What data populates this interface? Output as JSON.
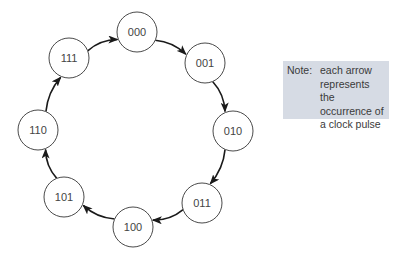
{
  "diagram": {
    "type": "state-cycle",
    "node_radius": 20,
    "nodes": [
      {
        "id": "000",
        "label": "000",
        "cx": 137,
        "cy": 32
      },
      {
        "id": "001",
        "label": "001",
        "cx": 205,
        "cy": 63
      },
      {
        "id": "010",
        "label": "010",
        "cx": 233,
        "cy": 131
      },
      {
        "id": "011",
        "label": "011",
        "cx": 202,
        "cy": 203
      },
      {
        "id": "100",
        "label": "100",
        "cx": 133,
        "cy": 227
      },
      {
        "id": "101",
        "label": "101",
        "cx": 64,
        "cy": 197
      },
      {
        "id": "110",
        "label": "110",
        "cx": 38,
        "cy": 130
      },
      {
        "id": "111",
        "label": "111",
        "cx": 69,
        "cy": 58
      }
    ],
    "edges": [
      {
        "from": "000",
        "to": "001"
      },
      {
        "from": "001",
        "to": "010"
      },
      {
        "from": "010",
        "to": "011"
      },
      {
        "from": "011",
        "to": "100"
      },
      {
        "from": "100",
        "to": "101"
      },
      {
        "from": "101",
        "to": "110"
      },
      {
        "from": "110",
        "to": "111"
      },
      {
        "from": "111",
        "to": "000"
      }
    ],
    "colors": {
      "edge": "#1a1a1a",
      "node_stroke": "#4a4a4a",
      "note_background": "#d6dbe4"
    }
  },
  "note": {
    "prefix": "Note:",
    "lines": [
      "each arrow",
      "represents the",
      "occurrence of",
      "a clock pulse"
    ]
  }
}
